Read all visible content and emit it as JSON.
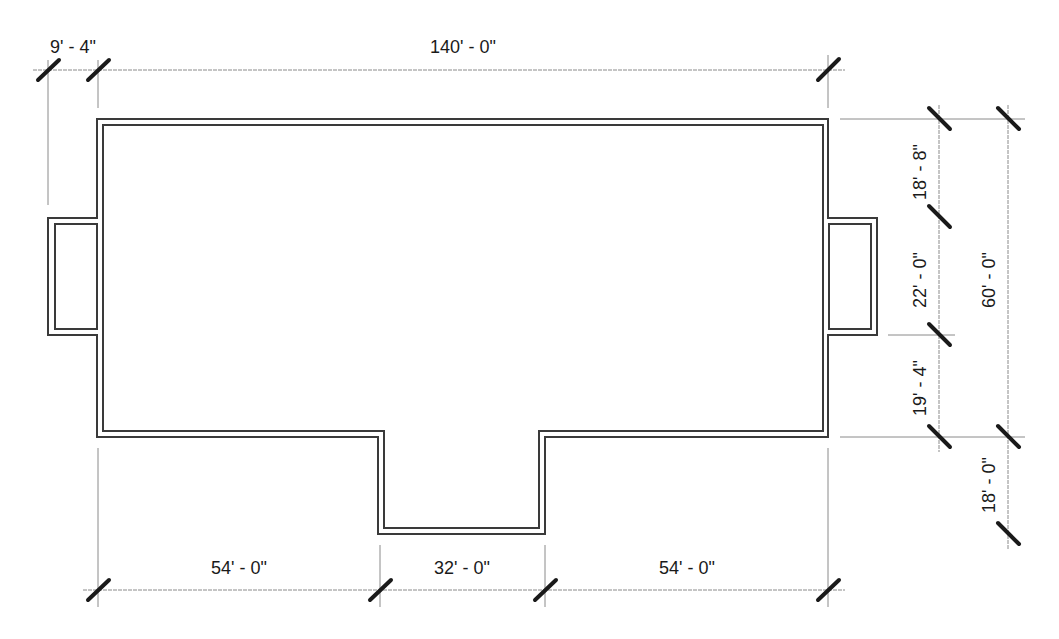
{
  "drawing": {
    "type": "floor-plan-outline",
    "units": "feet-inches",
    "colors": {
      "wall": "#3a3a3a",
      "dimension_line": "#8a8a8a",
      "tick": "#1a1a1a",
      "text": "#1a1a1a",
      "background": "#ffffff"
    }
  },
  "dimensions": {
    "top": [
      {
        "id": "left-bump-depth",
        "label": "9' - 4\""
      },
      {
        "id": "overall-width",
        "label": "140' - 0\""
      }
    ],
    "bottom": [
      {
        "id": "bottom-left-segment",
        "label": "54' - 0\""
      },
      {
        "id": "bottom-center-bump",
        "label": "32' - 0\""
      },
      {
        "id": "bottom-right-segment",
        "label": "54' - 0\""
      }
    ],
    "right_inner": [
      {
        "id": "right-top-segment",
        "label": "18' - 8\""
      },
      {
        "id": "right-bump-width",
        "label": "22' - 0\""
      },
      {
        "id": "right-lower-segment",
        "label": "19' - 4\""
      }
    ],
    "right_outer": [
      {
        "id": "overall-depth",
        "label": "60' - 0\""
      },
      {
        "id": "bottom-bump-depth",
        "label": "18' - 0\""
      }
    ]
  }
}
